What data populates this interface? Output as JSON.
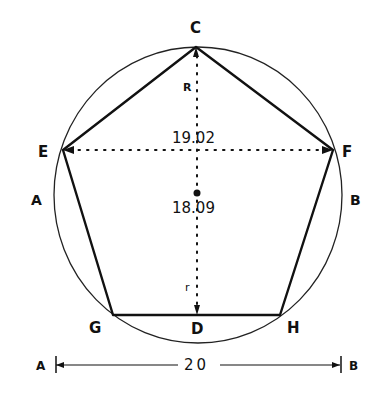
{
  "diagram": {
    "vertices": {
      "C": {
        "label": "C",
        "x": 196,
        "y": 47
      },
      "E": {
        "label": "E",
        "x": 63,
        "y": 150
      },
      "F": {
        "label": "F",
        "x": 333,
        "y": 150
      },
      "G": {
        "label": "G",
        "x": 113,
        "y": 315
      },
      "H": {
        "label": "H",
        "x": 280,
        "y": 315
      }
    },
    "points": {
      "D": {
        "label": "D",
        "x": 197,
        "y": 315
      },
      "center": {
        "x": 197,
        "y": 193
      }
    },
    "side_labels": {
      "left": "A",
      "right": "B"
    },
    "measurements": {
      "diagonal_EF": "19.02",
      "height_CD": "18.09",
      "circumradius": "R",
      "inradius": "r",
      "diameter_AB": "20"
    },
    "dimension_line": {
      "left_label": "A",
      "right_label": "B",
      "value": "20"
    },
    "colors": {
      "ink": "#111111",
      "background": "#ffffff"
    }
  }
}
